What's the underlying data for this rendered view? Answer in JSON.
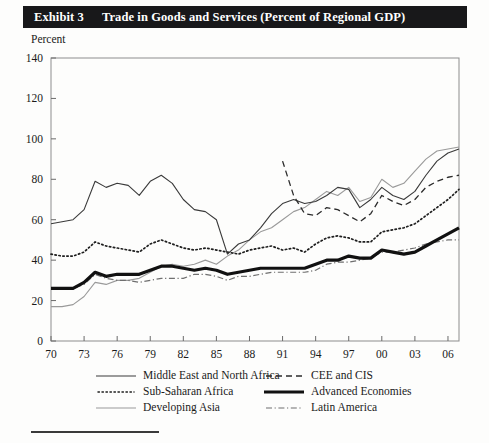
{
  "exhibit": {
    "number_label": "Exhibit 3",
    "title": "Trade in Goods and Services (Percent of Regional GDP)"
  },
  "axis_title": "Percent",
  "legend": {
    "entries": [
      {
        "label": "Middle East and North Africa",
        "style": "solid-thin",
        "color": "#3a3a3a"
      },
      {
        "label": "CEE and CIS",
        "style": "dashed",
        "color": "#2b2b2b"
      },
      {
        "label": "Sub-Saharan Africa",
        "style": "dotted",
        "color": "#1f1f1f"
      },
      {
        "label": "Advanced Economies",
        "style": "solid-thick",
        "color": "#111111"
      },
      {
        "label": "Developing Asia",
        "style": "solid-light",
        "color": "#9a9a9a"
      },
      {
        "label": "Latin America",
        "style": "dash-dot",
        "color": "#6f6f6f"
      }
    ]
  },
  "chart_data": {
    "type": "line",
    "title": "Trade in Goods and Services (Percent of Regional GDP)",
    "xlabel": "",
    "ylabel": "Percent",
    "ylim": [
      0,
      140
    ],
    "ytick_step": 20,
    "yticks": [
      0,
      20,
      40,
      60,
      80,
      100,
      120,
      140
    ],
    "xlim": [
      1970,
      2007
    ],
    "xticks": [
      1970,
      1973,
      1976,
      1979,
      1982,
      1985,
      1988,
      1991,
      1994,
      1997,
      2000,
      2003,
      2006
    ],
    "xtick_labels": [
      "70",
      "73",
      "76",
      "79",
      "82",
      "85",
      "88",
      "91",
      "94",
      "97",
      "00",
      "03",
      "06"
    ],
    "grid": false,
    "legend_position": "below",
    "x": [
      1970,
      1971,
      1972,
      1973,
      1974,
      1975,
      1976,
      1977,
      1978,
      1979,
      1980,
      1981,
      1982,
      1983,
      1984,
      1985,
      1986,
      1987,
      1988,
      1989,
      1990,
      1991,
      1992,
      1993,
      1994,
      1995,
      1996,
      1997,
      1998,
      1999,
      2000,
      2001,
      2002,
      2003,
      2004,
      2005,
      2006,
      2007
    ],
    "series": [
      {
        "name": "Middle East and North Africa",
        "style": "solid-thin",
        "color": "#3a3a3a",
        "values": [
          58,
          59,
          60,
          65,
          79,
          76,
          78,
          77,
          72,
          79,
          82,
          78,
          70,
          65,
          64,
          60,
          43,
          48,
          50,
          56,
          63,
          68,
          70,
          68,
          69,
          72,
          76,
          75,
          66,
          70,
          76,
          72,
          70,
          74,
          82,
          89,
          93,
          95
        ]
      },
      {
        "name": "CEE and CIS",
        "style": "dashed",
        "color": "#2b2b2b",
        "start_year": 1991,
        "values": [
          null,
          null,
          null,
          null,
          null,
          null,
          null,
          null,
          null,
          null,
          null,
          null,
          null,
          null,
          null,
          null,
          null,
          null,
          null,
          null,
          null,
          89,
          72,
          63,
          62,
          66,
          65,
          62,
          59,
          63,
          72,
          69,
          67,
          70,
          76,
          79,
          81,
          82
        ]
      },
      {
        "name": "Sub-Saharan Africa",
        "style": "dotted",
        "color": "#1f1f1f",
        "values": [
          43,
          42,
          42,
          44,
          49,
          47,
          46,
          45,
          44,
          48,
          50,
          48,
          46,
          45,
          46,
          45,
          44,
          43,
          45,
          46,
          47,
          45,
          46,
          44,
          48,
          51,
          52,
          51,
          49,
          49,
          54,
          55,
          56,
          58,
          62,
          66,
          70,
          75
        ]
      },
      {
        "name": "Advanced Economies",
        "style": "solid-thick",
        "color": "#111111",
        "values": [
          26,
          26,
          26,
          29,
          34,
          32,
          33,
          33,
          33,
          35,
          37,
          37,
          36,
          35,
          36,
          35,
          33,
          34,
          35,
          36,
          36,
          36,
          36,
          36,
          38,
          40,
          40,
          42,
          41,
          41,
          45,
          44,
          43,
          44,
          47,
          50,
          53,
          56
        ]
      },
      {
        "name": "Developing Asia",
        "style": "solid-light",
        "color": "#9a9a9a",
        "values": [
          17,
          17,
          18,
          22,
          29,
          28,
          30,
          30,
          31,
          34,
          37,
          38,
          37,
          38,
          40,
          38,
          42,
          45,
          50,
          54,
          56,
          60,
          64,
          66,
          70,
          74,
          72,
          76,
          69,
          71,
          80,
          76,
          78,
          84,
          90,
          94,
          95,
          96
        ]
      },
      {
        "name": "Latin America",
        "style": "dash-dot",
        "color": "#6f6f6f",
        "values": [
          26,
          26,
          26,
          28,
          33,
          31,
          30,
          30,
          29,
          30,
          31,
          31,
          31,
          33,
          33,
          32,
          30,
          32,
          32,
          33,
          34,
          34,
          34,
          34,
          35,
          38,
          39,
          39,
          40,
          41,
          44,
          44,
          45,
          46,
          48,
          49,
          50,
          50
        ]
      }
    ]
  }
}
